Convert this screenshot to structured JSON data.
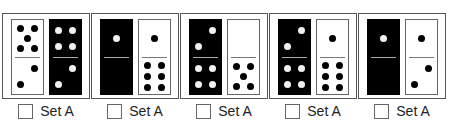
{
  "panels": [
    {
      "left": {
        "color": "white",
        "top": 5,
        "bottom": 2
      },
      "right": {
        "color": "black",
        "top": 4,
        "bottom": 2
      },
      "label": "Set A",
      "checked": false
    },
    {
      "left": {
        "color": "black",
        "top": 1,
        "bottom": 0
      },
      "right": {
        "color": "white",
        "top": 1,
        "bottom": 6
      },
      "label": "Set A",
      "checked": false
    },
    {
      "left": {
        "color": "black",
        "top": 2,
        "bottom": 4
      },
      "right": {
        "color": "white",
        "top": 0,
        "bottom": 5
      },
      "label": "Set A",
      "checked": false
    },
    {
      "left": {
        "color": "black",
        "top": 2,
        "bottom": 4
      },
      "right": {
        "color": "white",
        "top": 1,
        "bottom": 6
      },
      "label": "Set A",
      "checked": false
    },
    {
      "left": {
        "color": "black",
        "top": 1,
        "bottom": 0
      },
      "right": {
        "color": "white",
        "top": 1,
        "bottom": 2
      },
      "label": "Set A",
      "checked": false
    }
  ],
  "colors": {
    "tile_black": "#000000",
    "tile_white": "#ffffff",
    "border": "#555555"
  }
}
